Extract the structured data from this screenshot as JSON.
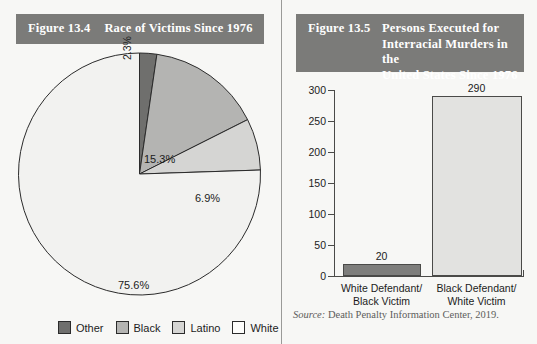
{
  "figure_left": {
    "figure_number": "Figure 13.4",
    "title": "Race of Victims Since 1976",
    "chart_data": {
      "type": "pie",
      "title": "Race of Victims Since 1976",
      "categories": [
        "Other",
        "Black",
        "Latino",
        "White"
      ],
      "values": [
        2.3,
        15.3,
        6.9,
        75.6
      ],
      "value_labels": [
        "2.3%",
        "15.3%",
        "6.9%",
        "75.6%"
      ],
      "units": "percent",
      "start_angle_deg": 0,
      "direction": "clockwise",
      "legend_position": "bottom",
      "colors": [
        "#6f6f6d",
        "#b4b4b2",
        "#d5d5d3",
        "#f2f2f0"
      ],
      "legend": [
        {
          "label": "Other",
          "color": "#6f6f6d"
        },
        {
          "label": "Black",
          "color": "#b4b4b2"
        },
        {
          "label": "Latino",
          "color": "#d5d5d3"
        },
        {
          "label": "White",
          "color": "#fdfdfb"
        }
      ]
    }
  },
  "figure_right": {
    "figure_number": "Figure 13.5",
    "title_lines": [
      "Persons Executed for",
      "Interracial Murders in the",
      "United States Since 1976"
    ],
    "chart_data": {
      "type": "bar",
      "title": "Persons Executed for Interracial Murders in the United States Since 1976",
      "categories": [
        "White Defendant/ Black Victim",
        "Black Defendant/ White Victim"
      ],
      "category_lines": [
        [
          "White Defendant/",
          "Black Victim"
        ],
        [
          "Black Defendant/",
          "White Victim"
        ]
      ],
      "values": [
        20,
        290
      ],
      "value_labels": [
        "20",
        "290"
      ],
      "colors": [
        "#7e7e7c",
        "#e2e2e0"
      ],
      "xlabel": "",
      "ylabel": "",
      "ylim": [
        0,
        300
      ],
      "y_ticks": [
        0,
        50,
        100,
        150,
        200,
        250,
        300
      ],
      "y_tick_labels": [
        "0",
        "50",
        "100",
        "150",
        "200",
        "250",
        "300"
      ],
      "grid": false,
      "legend_position": "none"
    },
    "source_prefix": "Source:",
    "source_text": "Death Penalty Information Center, 2019."
  },
  "colors": {
    "title_bar": "#7b7b79",
    "title_text": "#ffffff",
    "background": "#f7f7f5",
    "axis": "#4a4a48",
    "text": "#1c1c1c"
  }
}
